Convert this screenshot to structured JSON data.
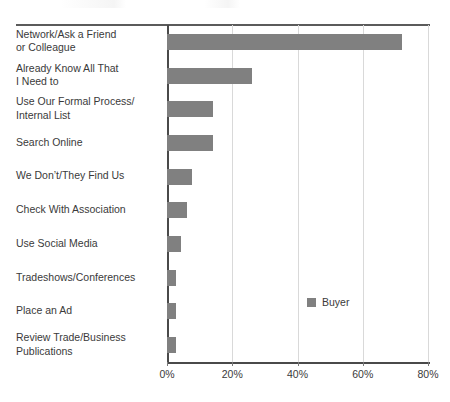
{
  "chart_data": {
    "type": "bar",
    "orientation": "horizontal",
    "title": "",
    "xlabel": "",
    "ylabel": "",
    "xlim": [
      0,
      80
    ],
    "xticks": [
      0,
      20,
      40,
      60,
      80
    ],
    "xtick_labels": [
      "0%",
      "20%",
      "40%",
      "60%",
      "80%"
    ],
    "grid": true,
    "legend_position": "inside-right",
    "bar_color": "#808080",
    "categories": [
      "Network/Ask a Friend or Colleague",
      "Already Know All That I Need to",
      "Use Our Formal Process/ Internal List",
      "Search Online",
      "We Don’t/They Find Us",
      "Check With Association",
      "Use Social Media",
      "Tradeshows/Conferences",
      "Place an Ad",
      "Review Trade/Business Publications"
    ],
    "category_lines": [
      [
        "Network/Ask a Friend",
        "or Colleague"
      ],
      [
        "Already Know All That",
        "I Need to"
      ],
      [
        "Use Our Formal Process/",
        "Internal List"
      ],
      [
        "Search Online"
      ],
      [
        "We Don’t/They Find Us"
      ],
      [
        "Check With Association"
      ],
      [
        "Use Social Media"
      ],
      [
        "Tradeshows/Conferences"
      ],
      [
        "Place an Ad"
      ],
      [
        "Review Trade/Business",
        "Publications"
      ]
    ],
    "series": [
      {
        "name": "Buyer",
        "color": "#808080",
        "values": [
          72,
          26,
          14,
          14,
          7.7,
          6,
          4.3,
          2.7,
          2.7,
          2.7
        ]
      }
    ]
  },
  "legend": {
    "entries": [
      {
        "label": "Buyer",
        "color": "#808080"
      }
    ]
  }
}
